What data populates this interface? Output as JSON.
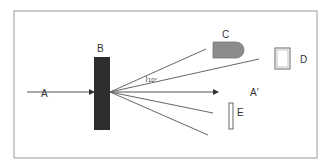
{
  "diagram": {
    "labels": {
      "A": "A",
      "B": "B",
      "C": "C",
      "D": "D",
      "E": "E",
      "A_prime": "A'",
      "angle": "10°"
    },
    "colors": {
      "frame": "#9a9a9a",
      "line": "#555555",
      "block_B": "#2e2e2e",
      "shape_C": "#8c8c8c",
      "background": "#ffffff"
    }
  }
}
